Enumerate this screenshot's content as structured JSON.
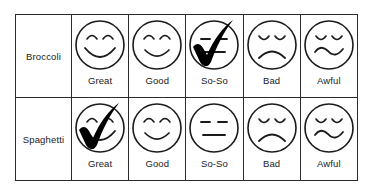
{
  "table": {
    "rating_columns": [
      {
        "key": "great",
        "label": "Great",
        "face": "big-smile-face"
      },
      {
        "key": "good",
        "label": "Good",
        "face": "smile-face"
      },
      {
        "key": "soso",
        "label": "So-So",
        "face": "neutral-face"
      },
      {
        "key": "bad",
        "label": "Bad",
        "face": "frown-face"
      },
      {
        "key": "awful",
        "label": "Awful",
        "face": "wavy-frown-face"
      }
    ],
    "rows": [
      {
        "key": "broccoli",
        "label": "Broccoli",
        "selected": "soso",
        "cells": [
          {
            "label": "Great",
            "face": "big-smile-face",
            "checked": false
          },
          {
            "label": "Good",
            "face": "smile-face",
            "checked": false
          },
          {
            "label": "So-So",
            "face": "neutral-face",
            "checked": true
          },
          {
            "label": "Bad",
            "face": "frown-face",
            "checked": false
          },
          {
            "label": "Awful",
            "face": "wavy-frown-face",
            "checked": false
          }
        ]
      },
      {
        "key": "spaghetti",
        "label": "Spaghetti",
        "selected": "great",
        "cells": [
          {
            "label": "Great",
            "face": "big-smile-face",
            "checked": true
          },
          {
            "label": "Good",
            "face": "smile-face",
            "checked": false
          },
          {
            "label": "So-So",
            "face": "neutral-face",
            "checked": false
          },
          {
            "label": "Bad",
            "face": "frown-face",
            "checked": false
          },
          {
            "label": "Awful",
            "face": "wavy-frown-face",
            "checked": false
          }
        ]
      }
    ]
  },
  "colors": {
    "border": "#2b2b2b",
    "ink": "#1a1a1a",
    "check": "#000000",
    "background": "#ffffff"
  }
}
